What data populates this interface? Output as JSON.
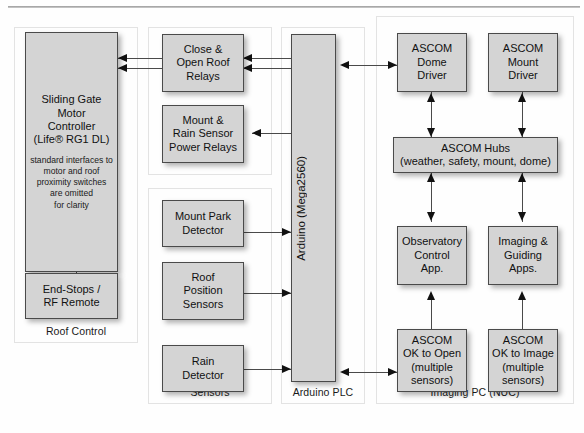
{
  "diagram": {
    "accent_fill": "#d4d4d4",
    "stroke": "#4a4a4a"
  },
  "panels": [
    {
      "id": "roof-control",
      "label": "Roof Control"
    },
    {
      "id": "relays",
      "label": ""
    },
    {
      "id": "sensors",
      "label": "Sensors"
    },
    {
      "id": "arduino-plc",
      "label": "Arduino PLC"
    },
    {
      "id": "imaging-pc",
      "label": "Imaging PC (NUC)"
    }
  ],
  "boxes": {
    "sliding_gate": {
      "line1": "Sliding Gate",
      "line2": "Motor",
      "line3": "Controller",
      "line4": "(Life® RG1 DL)",
      "note1": "standard interfaces to",
      "note2": "motor and roof",
      "note3": "proximity switches",
      "note4": "are omitted",
      "note5": "for clarity"
    },
    "end_stops": {
      "line1": "End-Stops /",
      "line2": "RF Remote"
    },
    "roof_relays": {
      "line1": "Close &",
      "line2": "Open Roof",
      "line3": "Relays"
    },
    "power_relays": {
      "line1": "Mount &",
      "line2": "Rain Sensor",
      "line3": "Power Relays"
    },
    "mount_park": {
      "line1": "Mount Park",
      "line2": "Detector"
    },
    "roof_position": {
      "line1": "Roof",
      "line2": "Position",
      "line3": "Sensors"
    },
    "rain_detector": {
      "line1": "Rain",
      "line2": "Detector"
    },
    "arduino": {
      "label": "Arduino (Mega2560)"
    },
    "dome_driver": {
      "line1": "ASCOM",
      "line2": "Dome",
      "line3": "Driver"
    },
    "mount_driver": {
      "line1": "ASCOM",
      "line2": "Mount",
      "line3": "Driver"
    },
    "ascom_hubs": {
      "line1": "ASCOM Hubs",
      "line2": "(weather, safety, mount, dome)"
    },
    "observatory_app": {
      "line1": "Observatory",
      "line2": "Control",
      "line3": "App."
    },
    "imaging_apps": {
      "line1": "Imaging &",
      "line2": "Guiding",
      "line3": "Apps."
    },
    "ok_to_open": {
      "line1": "ASCOM",
      "line2": "OK to Open",
      "line3": "(multiple",
      "line4": "sensors)"
    },
    "ok_to_image": {
      "line1": "ASCOM",
      "line2": "OK to Image",
      "line3": "(multiple",
      "line4": "sensors)"
    }
  }
}
